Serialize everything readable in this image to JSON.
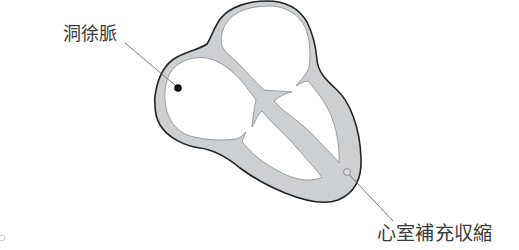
{
  "annotations": [
    {
      "label": "洞徐脈",
      "marker": "filled-dot"
    },
    {
      "label": "心室補充収縮",
      "marker": "hollow-circle"
    }
  ],
  "colors": {
    "wall_fill": "#cdd0d2",
    "outline": "#232323",
    "cavity_fill": "#ffffff",
    "cavity_outline": "#8f9294",
    "text": "#3a3a3a",
    "dot_fill": "#111111",
    "circle_fill": "#dcdedf",
    "leader_line": "#6a6a6a",
    "background": "#ffffff"
  }
}
